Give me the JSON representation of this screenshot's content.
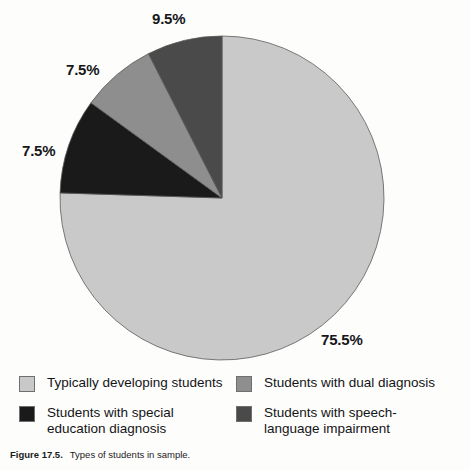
{
  "figure": {
    "caption_label": "Figure 17.5.",
    "caption_text": "Types of students in sample."
  },
  "colors": {
    "typically_developing": "#c9c9c9",
    "dual_diagnosis": "#8e8e8e",
    "special_education": "#1a1a1a",
    "speech_language": "#4a4a4a",
    "background": "#fdfdfb",
    "outline": "#6f6f6f",
    "text": "#16161a"
  },
  "labels": {
    "top": "9.5%",
    "upper_left": "7.5%",
    "left": "7.5%",
    "bottom_right": "75.5%"
  },
  "legend": {
    "items": [
      {
        "label": "Typically developing students",
        "color": "#c9c9c9",
        "swatch_name": "legend-swatch-typically-developing"
      },
      {
        "label": "Students with dual diagnosis",
        "color": "#8e8e8e",
        "swatch_name": "legend-swatch-dual-diagnosis"
      },
      {
        "label": "Students with special\neducation diagnosis",
        "color": "#1a1a1a",
        "swatch_name": "legend-swatch-special-education"
      },
      {
        "label": "Students with speech-\nlanguage impairment",
        "color": "#4a4a4a",
        "swatch_name": "legend-swatch-speech-language"
      }
    ]
  },
  "chart_data": {
    "type": "pie",
    "title": "Types of students in sample",
    "xlabel": "",
    "ylabel": "",
    "legend_position": "bottom",
    "grid": false,
    "start_angle_deg": 0,
    "direction": "clockwise",
    "categories": [
      "Typically developing students",
      "Students with special education diagnosis",
      "Students with dual diagnosis",
      "Students with speech-language impairment"
    ],
    "values": [
      75.5,
      9.5,
      7.5,
      7.5
    ],
    "value_labels": [
      "75.5%",
      "9.5%",
      "7.5%",
      "7.5%"
    ],
    "slice_colors": [
      "#c9c9c9",
      "#1a1a1a",
      "#8e8e8e",
      "#4a4a4a"
    ],
    "units": "percent",
    "total": 100.0
  }
}
